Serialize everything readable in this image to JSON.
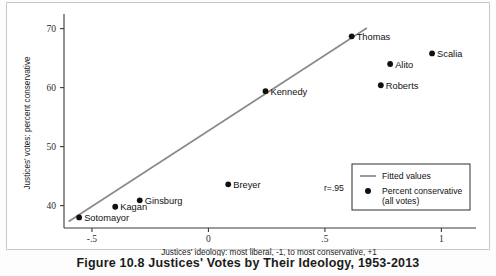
{
  "figure": {
    "caption": "Figure 10.8 Justices' Votes by Their Ideology, 1953-2013"
  },
  "chart_data": {
    "type": "scatter",
    "title": "",
    "xlabel": "Justices' ideology: most liberal, -1, to most conservative, +1",
    "ylabel": "Justices' votes: percent conservative",
    "xlim": [
      -0.62,
      1.14
    ],
    "ylim": [
      36.2,
      71.8
    ],
    "xticks": [
      -0.5,
      0,
      0.5,
      1
    ],
    "xticklabels": [
      "-.5",
      "0",
      ".5",
      "1"
    ],
    "yticks": [
      40,
      50,
      60,
      70
    ],
    "yticklabels": [
      "40",
      "50",
      "60",
      "70"
    ],
    "grid": false,
    "points": [
      {
        "label": "Sotomayor",
        "x": -0.555,
        "y": 38.0,
        "label_pos": "right"
      },
      {
        "label": "Kagan",
        "x": -0.4,
        "y": 39.8,
        "label_pos": "right"
      },
      {
        "label": "Ginsburg",
        "x": -0.295,
        "y": 40.9,
        "label_pos": "right"
      },
      {
        "label": "Breyer",
        "x": 0.085,
        "y": 43.6,
        "label_pos": "right"
      },
      {
        "label": "Kennedy",
        "x": 0.245,
        "y": 59.4,
        "label_pos": "right"
      },
      {
        "label": "Thomas",
        "x": 0.615,
        "y": 68.7,
        "label_pos": "right"
      },
      {
        "label": "Roberts",
        "x": 0.74,
        "y": 60.4,
        "label_pos": "right"
      },
      {
        "label": "Alito",
        "x": 0.78,
        "y": 64.0,
        "label_pos": "right"
      },
      {
        "label": "Scalia",
        "x": 0.96,
        "y": 65.8,
        "label_pos": "right"
      }
    ],
    "fit_line": {
      "x0": -0.6,
      "y0": 37.3,
      "x1": 0.68,
      "y1": 70.1
    },
    "annotation": {
      "text": "r=.95"
    },
    "legend": {
      "position": "bottom-right",
      "entries": [
        {
          "type": "line",
          "label": "Fitted values"
        },
        {
          "type": "marker",
          "label": "Percent conservative",
          "label2": "(all votes)"
        }
      ]
    }
  }
}
